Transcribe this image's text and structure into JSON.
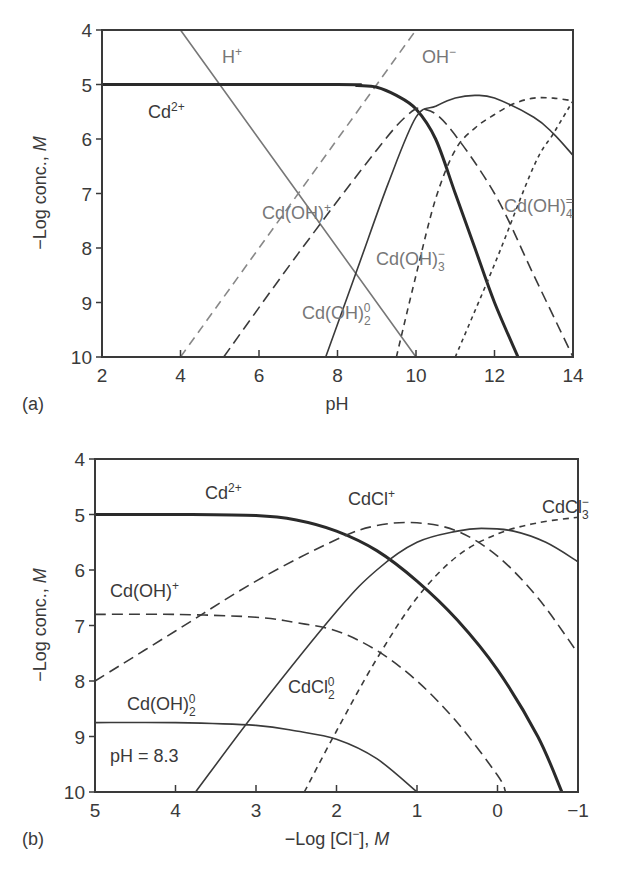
{
  "panels": {
    "a": {
      "label": "(a)",
      "xlabel": "pH",
      "ylabel": "−Log conc., M",
      "ylabel_prefix": "−Log conc., ",
      "ylabel_unit": "M",
      "xticks": [
        "2",
        "4",
        "6",
        "8",
        "10",
        "12",
        "14"
      ],
      "yticks": [
        "4",
        "5",
        "6",
        "7",
        "8",
        "9",
        "10"
      ],
      "species_labels": {
        "h": "H",
        "h_sup": "+",
        "oh": "OH",
        "oh_sup": "−",
        "cd": "Cd",
        "cd_sup": "2+",
        "cdoh": "Cd(OH)",
        "cdoh_sup": "+",
        "cdoh2": "Cd(OH)",
        "cdoh2_sub": "2",
        "cdoh2_sup": "0",
        "cdoh3": "Cd(OH)",
        "cdoh3_sub": "3",
        "cdoh3_sup": "−",
        "cdoh4": "Cd(OH)",
        "cdoh4_sub": "4",
        "cdoh4_sup": "="
      }
    },
    "b": {
      "label": "(b)",
      "xlabel_prefix": "−Log [Cl",
      "xlabel_sup": "−",
      "xlabel_suffix": "], ",
      "xlabel_unit": "M",
      "ylabel_prefix": "−Log conc., ",
      "ylabel_unit": "M",
      "xticks": [
        "5",
        "4",
        "3",
        "2",
        "1",
        "0",
        "−1"
      ],
      "yticks": [
        "4",
        "5",
        "6",
        "7",
        "8",
        "9",
        "10"
      ],
      "annotation": "pH = 8.3",
      "species_labels": {
        "cd": "Cd",
        "cd_sup": "2+",
        "cdcl": "CdCl",
        "cdcl_sup": "+",
        "cdcl2": "CdCl",
        "cdcl2_sub": "2",
        "cdcl2_sup": "0",
        "cdcl3": "CdCl",
        "cdcl3_sub": "3",
        "cdcl3_sup": "−",
        "cdoh": "Cd(OH)",
        "cdoh_sup": "+",
        "cdoh2": "Cd(OH)",
        "cdoh2_sub": "2",
        "cdoh2_sup": "0"
      }
    }
  },
  "chart_data": [
    {
      "type": "line",
      "title": "(a) Cadmium hydroxide speciation vs pH",
      "xlabel": "pH",
      "ylabel": "−Log conc., M",
      "xlim": [
        2,
        14
      ],
      "ylim": [
        10,
        4
      ],
      "y_inverted": true,
      "grid": false,
      "series": [
        {
          "name": "H+",
          "style": "solid-gray",
          "x": [
            4,
            10
          ],
          "y": [
            4,
            10
          ]
        },
        {
          "name": "OH-",
          "style": "dashed-gray",
          "x": [
            4,
            10
          ],
          "y": [
            10,
            4
          ]
        },
        {
          "name": "Cd2+",
          "style": "solid-thick",
          "x": [
            2,
            8,
            8.5,
            9,
            9.5,
            10,
            10.5,
            11,
            11.5,
            12,
            12.6
          ],
          "y": [
            5,
            5,
            5.02,
            5.05,
            5.2,
            5.45,
            6.0,
            7.0,
            8.0,
            9.0,
            10
          ]
        },
        {
          "name": "Cd(OH)+",
          "style": "dashed",
          "x": [
            5.1,
            7,
            9,
            9.8,
            10.2,
            10.8,
            12,
            13,
            14
          ],
          "y": [
            10,
            8.1,
            6.2,
            5.55,
            5.45,
            5.75,
            7.0,
            8.5,
            10
          ]
        },
        {
          "name": "Cd(OH)2 0",
          "style": "solid",
          "x": [
            7.7,
            8.5,
            9.3,
            10,
            10.5,
            11,
            11.5,
            12,
            13,
            13.5,
            14
          ],
          "y": [
            10,
            8.4,
            6.8,
            5.6,
            5.4,
            5.25,
            5.2,
            5.25,
            5.6,
            5.9,
            6.3
          ]
        },
        {
          "name": "Cd(OH)3 -",
          "style": "short-dashed",
          "x": [
            9.5,
            10,
            10.5,
            11,
            11.5,
            12,
            12.5,
            13,
            13.5,
            14
          ],
          "y": [
            10,
            8.5,
            7.1,
            6.2,
            5.8,
            5.55,
            5.35,
            5.25,
            5.25,
            5.3
          ]
        },
        {
          "name": "Cd(OH)4 =",
          "style": "dotted",
          "x": [
            11,
            12,
            13,
            13.5,
            14
          ],
          "y": [
            10,
            8.3,
            6.5,
            5.9,
            5.3
          ]
        }
      ]
    },
    {
      "type": "line",
      "title": "(b) Cadmium chloride speciation vs −Log [Cl−] at pH = 8.3",
      "xlabel": "−Log [Cl−], M",
      "ylabel": "−Log conc., M",
      "xlim": [
        5,
        -1
      ],
      "ylim": [
        10,
        4
      ],
      "y_inverted": true,
      "grid": false,
      "annotation": "pH = 8.3",
      "series": [
        {
          "name": "Cd2+",
          "style": "solid-thick",
          "x": [
            5,
            4,
            3,
            2.5,
            2,
            1.5,
            1,
            0.5,
            0,
            -0.5,
            -0.8
          ],
          "y": [
            5,
            5,
            5.02,
            5.1,
            5.3,
            5.65,
            6.2,
            6.9,
            7.8,
            9.0,
            10
          ]
        },
        {
          "name": "CdCl+",
          "style": "dashed",
          "x": [
            5,
            4,
            3,
            2,
            1.5,
            1,
            0.5,
            0,
            -0.5,
            -1
          ],
          "y": [
            8,
            7.1,
            6.2,
            5.45,
            5.2,
            5.15,
            5.3,
            5.75,
            6.5,
            7.5
          ]
        },
        {
          "name": "CdCl2 0",
          "style": "solid",
          "x": [
            3.75,
            3,
            2,
            1.5,
            1,
            0.5,
            0.2,
            -0.2,
            -0.6,
            -1
          ],
          "y": [
            10,
            8.55,
            6.75,
            6.0,
            5.5,
            5.3,
            5.25,
            5.3,
            5.5,
            5.85
          ]
        },
        {
          "name": "CdCl3 -",
          "style": "short-dashed",
          "x": [
            2.4,
            2,
            1.5,
            1,
            0.5,
            0,
            -0.5,
            -1
          ],
          "y": [
            10,
            8.9,
            7.6,
            6.5,
            5.75,
            5.35,
            5.15,
            5.05
          ]
        },
        {
          "name": "Cd(OH)+",
          "style": "dashed",
          "x": [
            5,
            4,
            3,
            2.5,
            2,
            1.5,
            1,
            0.5,
            0,
            -0.1
          ],
          "y": [
            6.8,
            6.8,
            6.85,
            6.95,
            7.1,
            7.45,
            8.0,
            8.75,
            9.7,
            10
          ]
        },
        {
          "name": "Cd(OH)2 0",
          "style": "solid",
          "x": [
            5,
            4,
            3,
            2.5,
            2,
            1.5,
            1
          ],
          "y": [
            8.75,
            8.75,
            8.8,
            8.9,
            9.05,
            9.4,
            10
          ]
        }
      ]
    }
  ]
}
